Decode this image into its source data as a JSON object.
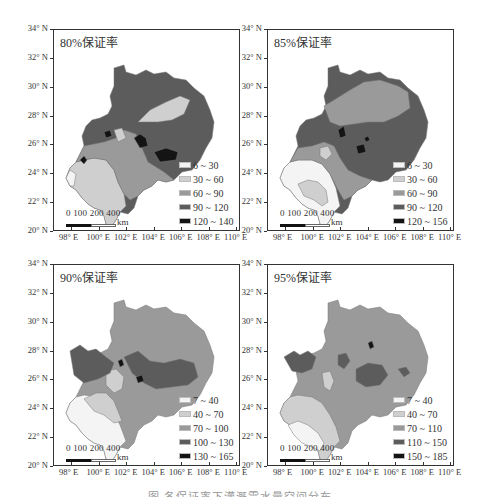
{
  "figure": {
    "caption": "图  各保证率下灌溉需水量空间分布",
    "panels": [
      {
        "title": "80%保证率",
        "legend": [
          {
            "label": "6 ~ 30",
            "color": "#f4f4f4"
          },
          {
            "label": "30 ~ 60",
            "color": "#cfcfcf"
          },
          {
            "label": "60 ~ 90",
            "color": "#9a9a9a"
          },
          {
            "label": "90 ~ 120",
            "color": "#5c5c5c"
          },
          {
            "label": "120 ~ 140",
            "color": "#141414"
          }
        ]
      },
      {
        "title": "85%保证率",
        "legend": [
          {
            "label": "6 ~ 30",
            "color": "#f4f4f4"
          },
          {
            "label": "30 ~ 60",
            "color": "#cfcfcf"
          },
          {
            "label": "60 ~ 90",
            "color": "#9a9a9a"
          },
          {
            "label": "90 ~ 120",
            "color": "#5c5c5c"
          },
          {
            "label": "120 ~ 156",
            "color": "#141414"
          }
        ]
      },
      {
        "title": "90%保证率",
        "legend": [
          {
            "label": "7 ~ 40",
            "color": "#f4f4f4"
          },
          {
            "label": "40 ~ 70",
            "color": "#cfcfcf"
          },
          {
            "label": "70 ~ 100",
            "color": "#9a9a9a"
          },
          {
            "label": "100 ~ 130",
            "color": "#5c5c5c"
          },
          {
            "label": "130 ~ 165",
            "color": "#141414"
          }
        ]
      },
      {
        "title": "95%保证率",
        "legend": [
          {
            "label": "7 ~ 40",
            "color": "#f4f4f4"
          },
          {
            "label": "40 ~ 70",
            "color": "#cfcfcf"
          },
          {
            "label": "70 ~ 110",
            "color": "#9a9a9a"
          },
          {
            "label": "110 ~ 150",
            "color": "#5c5c5c"
          },
          {
            "label": "150 ~ 185",
            "color": "#141414"
          }
        ]
      }
    ],
    "y_ticks": [
      "34° N",
      "32° N",
      "30° N",
      "28° N",
      "26° N",
      "24° N",
      "22° N",
      "20° N"
    ],
    "x_ticks": [
      "98° E",
      "100° E",
      "102° E",
      "104° E",
      "106° E",
      "108° E",
      "110° E"
    ],
    "scale_bar": {
      "labels": "0 100 200    400",
      "unit": "km"
    }
  },
  "chart_data": {
    "type": "heatmap",
    "title": "各保证率下灌溉需水量空间分布",
    "xlabel": "Longitude",
    "ylabel": "Latitude",
    "xlim": [
      "97° E",
      "111° E"
    ],
    "ylim": [
      "20° N",
      "34° N"
    ],
    "x_tick_labels": [
      "98° E",
      "100° E",
      "102° E",
      "104° E",
      "106° E",
      "108° E",
      "110° E"
    ],
    "y_tick_labels": [
      "20° N",
      "22° N",
      "24° N",
      "26° N",
      "28° N",
      "30° N",
      "32° N",
      "34° N"
    ],
    "panels": [
      {
        "name": "80%保证率",
        "classes": [
          "6 ~ 30",
          "30 ~ 60",
          "60 ~ 90",
          "90 ~ 120",
          "120 ~ 140"
        ]
      },
      {
        "name": "85%保证率",
        "classes": [
          "6 ~ 30",
          "30 ~ 60",
          "60 ~ 90",
          "90 ~ 120",
          "120 ~ 156"
        ]
      },
      {
        "name": "90%保证率",
        "classes": [
          "7 ~ 40",
          "40 ~ 70",
          "70 ~ 100",
          "100 ~ 130",
          "130 ~ 165"
        ]
      },
      {
        "name": "95%保证率",
        "classes": [
          "7 ~ 40",
          "40 ~ 70",
          "70 ~ 110",
          "110 ~ 150",
          "150 ~ 185"
        ]
      }
    ],
    "legend_position": "lower right",
    "grid": false
  }
}
